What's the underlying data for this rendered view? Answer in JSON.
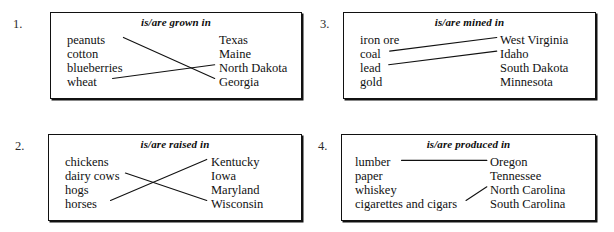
{
  "page": {
    "type": "matching-exercise-worksheet",
    "background_color": "#ffffff",
    "ink_color": "#111111"
  },
  "exercises": [
    {
      "number": "1.",
      "heading": "is/are grown in",
      "left_items": [
        "peanuts",
        "cotton",
        "blueberries",
        "wheat"
      ],
      "right_items": [
        "Texas",
        "Maine",
        "North Dakota",
        "Georgia"
      ],
      "matches": [
        {
          "left": "peanuts",
          "right": "Georgia"
        },
        {
          "left": "wheat",
          "right": "North Dakota"
        }
      ]
    },
    {
      "number": "2.",
      "heading": "is/are raised in",
      "left_items": [
        "chickens",
        "dairy cows",
        "hogs",
        "horses"
      ],
      "right_items": [
        "Kentucky",
        "Iowa",
        "Maryland",
        "Wisconsin"
      ],
      "matches": [
        {
          "left": "dairy cows",
          "right": "Wisconsin"
        },
        {
          "left": "horses",
          "right": "Kentucky"
        }
      ]
    },
    {
      "number": "3.",
      "heading": "is/are mined in",
      "left_items": [
        "iron ore",
        "coal",
        "lead",
        "gold"
      ],
      "right_items": [
        "West Virginia",
        "Idaho",
        "South Dakota",
        "Minnesota"
      ],
      "matches": [
        {
          "left": "coal",
          "right": "West Virginia"
        },
        {
          "left": "lead",
          "right": "Idaho"
        }
      ]
    },
    {
      "number": "4.",
      "heading": "is/are produced in",
      "left_items": [
        "lumber",
        "paper",
        "whiskey",
        "cigarettes and cigars"
      ],
      "right_items": [
        "Oregon",
        "Tennessee",
        "North Carolina",
        "South Carolina"
      ],
      "matches": [
        {
          "left": "lumber",
          "right": "Oregon"
        },
        {
          "left": "cigarettes and cigars",
          "right": "North Carolina"
        }
      ]
    }
  ]
}
